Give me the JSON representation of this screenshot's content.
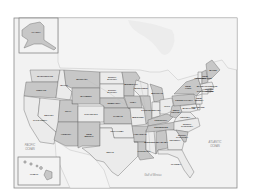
{
  "map": {
    "title": "United States",
    "insets": {
      "alaska": {
        "label": "ALASKA"
      },
      "hawaii": {
        "label": "HAWAII"
      }
    },
    "water_labels": {
      "pacific": [
        "PACIFIC",
        "OCEAN"
      ],
      "atlantic": [
        "ATLANTIC",
        "OCEAN"
      ],
      "gulf": "Gulf of Mexico"
    },
    "states": [
      {
        "id": "WA",
        "label": "WASHINGTON",
        "shade": "b"
      },
      {
        "id": "OR",
        "label": "OREGON",
        "shade": "a"
      },
      {
        "id": "CA",
        "label": "CALIFORNIA",
        "shade": "c"
      },
      {
        "id": "ID",
        "label": "IDAHO",
        "shade": "c"
      },
      {
        "id": "NV",
        "label": "NEVADA",
        "shade": "c"
      },
      {
        "id": "MT",
        "label": "MONTANA",
        "shade": "a"
      },
      {
        "id": "WY",
        "label": "WYOMING",
        "shade": "a"
      },
      {
        "id": "UT",
        "label": "UTAH",
        "shade": "a"
      },
      {
        "id": "CO",
        "label": "COLORADO",
        "shade": "c"
      },
      {
        "id": "AZ",
        "label": "ARIZONA",
        "shade": "a"
      },
      {
        "id": "NM",
        "label": "NEW MEXICO",
        "shade": "a"
      },
      {
        "id": "ND",
        "label": "NORTH DAKOTA",
        "shade": "c"
      },
      {
        "id": "SD",
        "label": "SOUTH DAKOTA",
        "shade": "c"
      },
      {
        "id": "NE",
        "label": "NEBRASKA",
        "shade": "a"
      },
      {
        "id": "KS",
        "label": "KANSAS",
        "shade": "a"
      },
      {
        "id": "OK",
        "label": "OKLAHOMA",
        "shade": "c"
      },
      {
        "id": "TX",
        "label": "TEXAS",
        "shade": "c"
      },
      {
        "id": "MN",
        "label": "MINNESOTA",
        "shade": "a"
      },
      {
        "id": "IA",
        "label": "IOWA",
        "shade": "a"
      },
      {
        "id": "MO",
        "label": "MISSOURI",
        "shade": "c"
      },
      {
        "id": "AR",
        "label": "ARKANSAS",
        "shade": "a"
      },
      {
        "id": "LA",
        "label": "LOUISIANA",
        "shade": "a"
      },
      {
        "id": "WI",
        "label": "WISCONSIN",
        "shade": "c"
      },
      {
        "id": "IL",
        "label": "ILLINOIS",
        "shade": "a"
      },
      {
        "id": "MS",
        "label": "MISSISSIPPI",
        "shade": "c"
      },
      {
        "id": "MI",
        "label": "MICHIGAN",
        "shade": "a"
      },
      {
        "id": "IN",
        "label": "INDIANA",
        "shade": "c"
      },
      {
        "id": "KY",
        "label": "KENTUCKY",
        "shade": "a"
      },
      {
        "id": "TN",
        "label": "TENNESSEE",
        "shade": "a"
      },
      {
        "id": "AL",
        "label": "ALABAMA",
        "shade": "a"
      },
      {
        "id": "OH",
        "label": "OHIO",
        "shade": "c"
      },
      {
        "id": "GA",
        "label": "GEORGIA",
        "shade": "c"
      },
      {
        "id": "FL",
        "label": "FLORIDA",
        "shade": "c"
      },
      {
        "id": "WV",
        "label": "WEST VIRGINIA",
        "shade": "a"
      },
      {
        "id": "VA",
        "label": "VIRGINIA",
        "shade": "c"
      },
      {
        "id": "NC",
        "label": "NORTH CAROLINA",
        "shade": "c"
      },
      {
        "id": "SC",
        "label": "SOUTH CAROLINA",
        "shade": "a"
      },
      {
        "id": "PA",
        "label": "PENNSYLVANIA",
        "shade": "a"
      },
      {
        "id": "NY",
        "label": "NEW YORK",
        "shade": "a"
      },
      {
        "id": "VT",
        "label": "VERMONT",
        "shade": "c"
      },
      {
        "id": "NH",
        "label": "NEW HAMPSHIRE",
        "shade": "a"
      },
      {
        "id": "ME",
        "label": "MAINE",
        "shade": "a"
      },
      {
        "id": "MA",
        "label": "MASSACHUSETTS",
        "shade": "c"
      },
      {
        "id": "RI",
        "label": "RHODE ISLAND",
        "shade": "a"
      },
      {
        "id": "CT",
        "label": "CONNECTICUT",
        "shade": "c"
      },
      {
        "id": "NJ",
        "label": "NEW JERSEY",
        "shade": "c"
      },
      {
        "id": "DE",
        "label": "DELAWARE",
        "shade": "c"
      },
      {
        "id": "MD",
        "label": "MARYLAND",
        "shade": "c"
      }
    ]
  }
}
